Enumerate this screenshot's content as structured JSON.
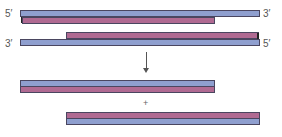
{
  "diagram": {
    "colors": {
      "strand_a": "#8f9fcf",
      "strand_b": "#b06a92",
      "outline": "#4a4660"
    },
    "top_duplex_1": {
      "left_label": "5′",
      "right_label": "3′",
      "upper_strand": "blue",
      "lower_strand": "pink"
    },
    "top_duplex_2": {
      "left_label": "3′",
      "right_label": "5′",
      "upper_strand": "pink",
      "lower_strand": "blue"
    },
    "arrow": "↓",
    "plus": "+",
    "product_1": {
      "upper_strand": "blue",
      "lower_strand": "pink"
    },
    "product_2": {
      "upper_strand": "pink",
      "lower_strand": "blue"
    }
  }
}
